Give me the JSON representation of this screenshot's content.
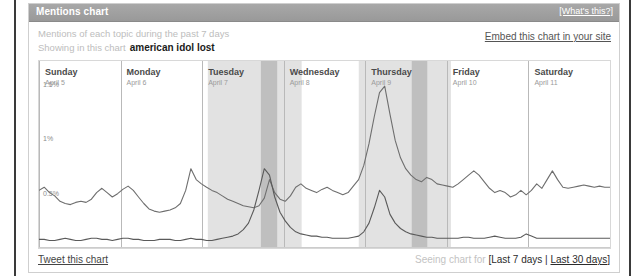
{
  "window": {
    "title": "Mentions chart",
    "whats_this_label": "[What's this?]"
  },
  "subhead": {
    "line1": "Mentions of each topic during the past 7 days",
    "line2": "Showing in this chart",
    "topics_label": "american idol  lost",
    "embed_label": "Embed this chart in your site"
  },
  "footer": {
    "tweet_label": "Tweet this chart",
    "seeing_label": "Seeing chart for",
    "bracket_open": "[",
    "range_current": "Last 7 days",
    "range_separator": " | ",
    "range_other": "Last 30 days",
    "bracket_close": "]"
  },
  "chart_data": {
    "type": "line",
    "title": "Mentions chart",
    "xlabel": "",
    "ylabel": "",
    "ylim": [
      0,
      1.6
    ],
    "grid": false,
    "legend_position": "none",
    "ytick_labels": [
      "1.5%",
      "1%",
      "0.5%"
    ],
    "ytick_values": [
      1.5,
      1.0,
      0.5
    ],
    "day_labels": [
      {
        "name": "Sunday",
        "date": "April 5"
      },
      {
        "name": "Monday",
        "date": "April 6"
      },
      {
        "name": "Tuesday",
        "date": "April 7"
      },
      {
        "name": "Wednesday",
        "date": "April 8"
      },
      {
        "name": "Thursday",
        "date": "April 9"
      },
      {
        "name": "Friday",
        "date": "April 10"
      },
      {
        "name": "Saturday",
        "date": "April 11"
      }
    ],
    "shaded_bands": [
      {
        "start": 2.07,
        "end": 3.22,
        "shade": "light"
      },
      {
        "start": 2.72,
        "end": 2.92,
        "shade": "dark"
      },
      {
        "start": 3.92,
        "end": 5.05,
        "shade": "light"
      },
      {
        "start": 4.57,
        "end": 4.76,
        "shade": "dark"
      }
    ],
    "series": [
      {
        "name": "american idol",
        "color": "#6e6e6e",
        "values": [
          0.52,
          0.55,
          0.5,
          0.47,
          0.42,
          0.4,
          0.39,
          0.41,
          0.42,
          0.41,
          0.44,
          0.5,
          0.54,
          0.5,
          0.46,
          0.49,
          0.53,
          0.56,
          0.52,
          0.46,
          0.4,
          0.35,
          0.33,
          0.32,
          0.33,
          0.34,
          0.36,
          0.4,
          0.52,
          0.72,
          0.62,
          0.58,
          0.55,
          0.52,
          0.5,
          0.47,
          0.44,
          0.42,
          0.4,
          0.38,
          0.37,
          0.36,
          0.38,
          0.45,
          0.62,
          0.5,
          0.44,
          0.42,
          0.47,
          0.55,
          0.58,
          0.54,
          0.52,
          0.5,
          0.53,
          0.55,
          0.52,
          0.5,
          0.48,
          0.5,
          0.56,
          0.62,
          0.75,
          0.95,
          1.2,
          1.42,
          1.48,
          1.22,
          0.98,
          0.82,
          0.72,
          0.66,
          0.62,
          0.6,
          0.64,
          0.62,
          0.58,
          0.57,
          0.56,
          0.55,
          0.58,
          0.62,
          0.66,
          0.7,
          0.66,
          0.6,
          0.54,
          0.5,
          0.52,
          0.5,
          0.46,
          0.48,
          0.52,
          0.48,
          0.52,
          0.58,
          0.54,
          0.62,
          0.7,
          0.62,
          0.55,
          0.54,
          0.55,
          0.56,
          0.57,
          0.56,
          0.55,
          0.56,
          0.55,
          0.55
        ]
      },
      {
        "name": "lost",
        "color": "#5a5a5a",
        "values": [
          0.07,
          0.07,
          0.06,
          0.06,
          0.07,
          0.08,
          0.07,
          0.06,
          0.06,
          0.07,
          0.08,
          0.08,
          0.07,
          0.07,
          0.06,
          0.07,
          0.08,
          0.08,
          0.07,
          0.07,
          0.06,
          0.06,
          0.06,
          0.07,
          0.07,
          0.07,
          0.06,
          0.06,
          0.07,
          0.08,
          0.07,
          0.07,
          0.06,
          0.06,
          0.07,
          0.08,
          0.09,
          0.1,
          0.12,
          0.16,
          0.22,
          0.34,
          0.52,
          0.72,
          0.66,
          0.46,
          0.32,
          0.24,
          0.18,
          0.14,
          0.12,
          0.11,
          0.1,
          0.1,
          0.09,
          0.09,
          0.08,
          0.08,
          0.08,
          0.08,
          0.09,
          0.1,
          0.14,
          0.22,
          0.36,
          0.52,
          0.46,
          0.3,
          0.22,
          0.17,
          0.14,
          0.12,
          0.11,
          0.1,
          0.09,
          0.09,
          0.08,
          0.08,
          0.08,
          0.08,
          0.08,
          0.09,
          0.09,
          0.08,
          0.08,
          0.08,
          0.09,
          0.1,
          0.09,
          0.08,
          0.08,
          0.08,
          0.09,
          0.12,
          0.1,
          0.08,
          0.08,
          0.08,
          0.08,
          0.08,
          0.08,
          0.08,
          0.08,
          0.08,
          0.08,
          0.08,
          0.08,
          0.08,
          0.08,
          0.08
        ]
      }
    ]
  }
}
